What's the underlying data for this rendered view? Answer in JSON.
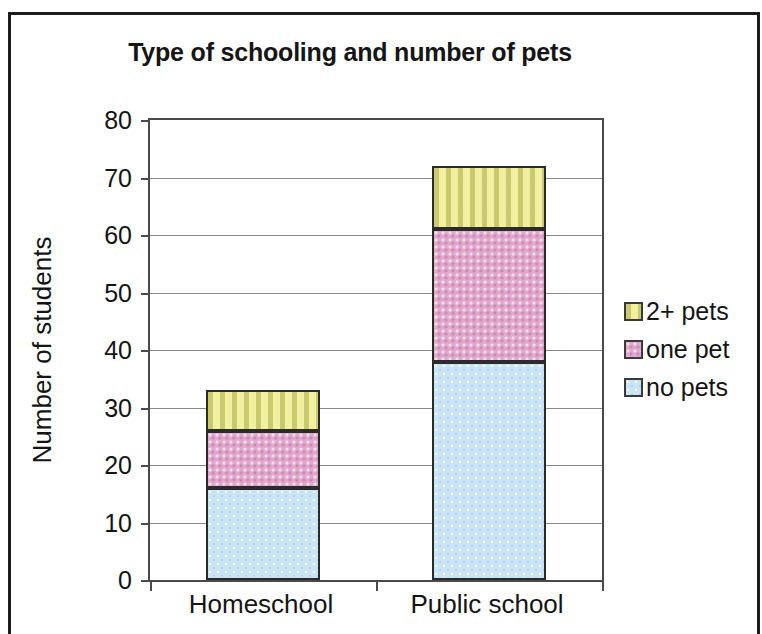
{
  "chart_data": {
    "type": "bar",
    "subtype": "stacked-bar",
    "title": "Type of schooling and number of pets",
    "xlabel": "",
    "ylabel": "Number of students",
    "categories": [
      "Homeschool",
      "Public school"
    ],
    "series": [
      {
        "name": "no pets",
        "color": "#c8e4f5",
        "values": [
          16,
          38
        ]
      },
      {
        "name": "one pet",
        "color": "#e0a8cc",
        "values": [
          10,
          23
        ]
      },
      {
        "name": "2+ pets",
        "color": "#f0f0a0",
        "values": [
          7,
          11
        ]
      }
    ],
    "cumulative_tops": {
      "Homeschool": {
        "no pets": 16,
        "one pet": 26,
        "2+ pets": 33
      },
      "Public school": {
        "no pets": 38,
        "one pet": 61,
        "2+ pets": 72
      }
    },
    "totals": [
      33,
      72
    ],
    "ylim": [
      0,
      80
    ],
    "ytick_step": 10,
    "yticks": [
      80,
      70,
      60,
      50,
      40,
      30,
      20,
      10,
      0
    ],
    "grid": true,
    "legend_position": "right",
    "legend_order": [
      "2+ pets",
      "one pet",
      "no pets"
    ]
  },
  "legend": {
    "items": [
      {
        "label": "2+ pets",
        "swatch": "legend-swatch-2pets"
      },
      {
        "label": "one pet",
        "swatch": "legend-swatch-onepet"
      },
      {
        "label": "no pets",
        "swatch": "legend-swatch-nopets"
      }
    ]
  }
}
